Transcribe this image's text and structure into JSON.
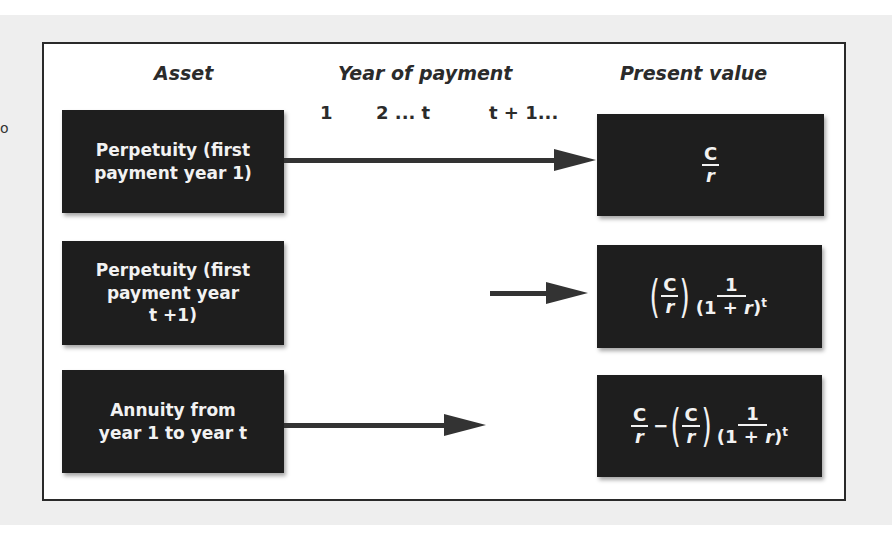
{
  "headers": {
    "asset": "Asset",
    "year_of_payment": "Year of payment",
    "present_value": "Present value"
  },
  "year_ticks": [
    "1",
    "2 ... t",
    "t + 1..."
  ],
  "stray_mark": "o",
  "rows": [
    {
      "asset": "Perpetuity (first\npayment year 1)",
      "arrow": {
        "from_year": "1",
        "to": "infinity"
      },
      "present_value": {
        "text": "C/r",
        "C": "C",
        "r": "r"
      }
    },
    {
      "asset": "Perpetuity (first\npayment year\nt +1)",
      "arrow": {
        "from_year": "t + 1",
        "to": "infinity"
      },
      "present_value": {
        "text": "(C/r) · 1/(1 + r)^t",
        "C": "C",
        "r": "r",
        "one": "1",
        "den_open": "(1 + ",
        "den_r": "r",
        "den_close": ")",
        "exp": "t"
      }
    },
    {
      "asset": "Annuity from\nyear 1 to year t",
      "arrow": {
        "from_year": "1",
        "to": "t"
      },
      "present_value": {
        "text": "C/r − (C/r) · 1/(1 + r)^t",
        "C": "C",
        "r": "r",
        "minus": "−",
        "one": "1",
        "den_open": "(1 + ",
        "den_r": "r",
        "den_close": ")",
        "exp": "t"
      }
    }
  ],
  "colors": {
    "box_fill": "#1e1e1e",
    "box_text": "#f2f2f2",
    "arrow": "#333333",
    "frame_border": "#2a2a2a",
    "page_bg": "#eeeeee"
  }
}
